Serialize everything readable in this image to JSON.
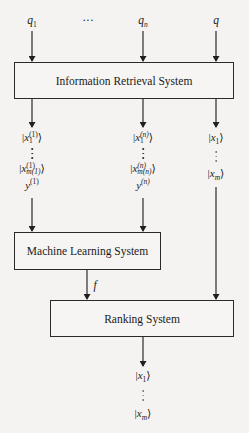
{
  "diagram": {
    "type": "flowchart",
    "inputs": {
      "q1": {
        "base": "q",
        "sub": "1"
      },
      "ellipsis": "···",
      "qn": {
        "base": "q",
        "sub": "n"
      },
      "q": {
        "base": "q"
      }
    },
    "boxes": {
      "ir": {
        "label": "Information Retrieval System"
      },
      "ml": {
        "label": "Machine Learning System"
      },
      "rank": {
        "label": "Ranking System"
      }
    },
    "columns": {
      "col1": {
        "first": {
          "var": "x",
          "sub": "1",
          "sup": "(1)"
        },
        "last": {
          "var": "x",
          "sub": "m(1)",
          "sup": "(1)"
        },
        "y": {
          "var": "y",
          "sup": "(1)"
        }
      },
      "coln": {
        "first": {
          "var": "x",
          "sub": "1",
          "sup": "(n)"
        },
        "last": {
          "var": "x",
          "sub": "m(n)",
          "sup": "(n)"
        },
        "y": {
          "var": "y",
          "sup": "(n)"
        }
      },
      "colq": {
        "first": {
          "var": "x",
          "sub": "1"
        },
        "last": {
          "var": "x",
          "sub": "m"
        }
      }
    },
    "edge_labels": {
      "f": "f"
    },
    "output": {
      "first": {
        "var": "x",
        "sub": "1"
      },
      "last": {
        "var": "x",
        "sub": "m"
      }
    },
    "ket_open": "|",
    "ket_close": "⟩",
    "colors": {
      "line": "#2a2a2a",
      "background": "#f4f3f1"
    }
  }
}
